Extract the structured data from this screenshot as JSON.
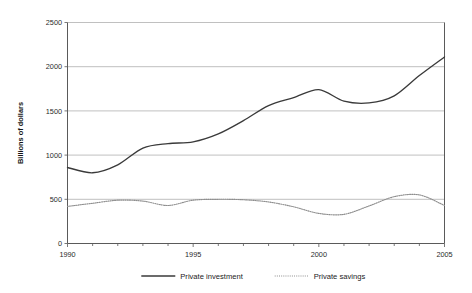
{
  "chart_data": {
    "type": "line",
    "title": "",
    "xlabel": "",
    "ylabel": "Billions of dollars",
    "xlim": [
      1990,
      2005
    ],
    "ylim": [
      0,
      2500
    ],
    "ytick_labels": [
      "0",
      "500",
      "1000",
      "1500",
      "2000",
      "2500"
    ],
    "ytick_values": [
      0,
      500,
      1000,
      1500,
      2000,
      2500
    ],
    "xtick_labels": [
      "1990",
      "1995",
      "2000",
      "2005"
    ],
    "xtick_values": [
      1990,
      1995,
      2000,
      2005
    ],
    "minor_xticks": [
      1991,
      1992,
      1993,
      1994,
      1996,
      1997,
      1998,
      1999,
      2001,
      2002,
      2003,
      2004
    ],
    "grid": "horizontal",
    "legend_position": "bottom",
    "x": [
      1990,
      1991,
      1992,
      1993,
      1994,
      1995,
      1996,
      1997,
      1998,
      1999,
      2000,
      2001,
      2002,
      2003,
      2004,
      2005
    ],
    "series": [
      {
        "name": "Private investment",
        "style": "solid",
        "color": "#3a3a3a",
        "values": [
          860,
          800,
          890,
          1080,
          1130,
          1150,
          1240,
          1390,
          1560,
          1650,
          1740,
          1610,
          1590,
          1670,
          1900,
          2110
        ]
      },
      {
        "name": "Private savings",
        "style": "dotted",
        "color": "#8e8e8e",
        "values": [
          420,
          455,
          490,
          480,
          430,
          490,
          500,
          495,
          470,
          415,
          340,
          330,
          425,
          530,
          550,
          430
        ]
      }
    ]
  },
  "legend": {
    "items": [
      {
        "label": "Private investment",
        "style": "solid"
      },
      {
        "label": "Private savings",
        "style": "dotted"
      }
    ]
  },
  "axes": {
    "y_axis_title": "Billions of dollars"
  }
}
